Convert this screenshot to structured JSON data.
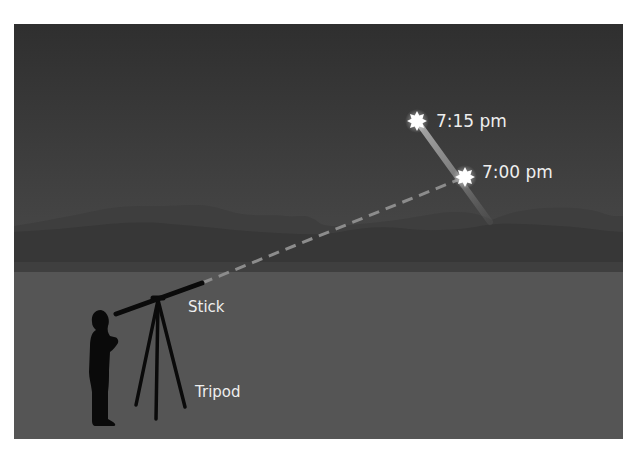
{
  "figure": {
    "colors": {
      "background": "#ffffff",
      "sky_top": "#2f2f2f",
      "sky_bottom": "#4a4a4a",
      "far_mountains": "#3e3e3e",
      "near_mountains": "#363636",
      "ground": "#555555",
      "silhouette": "#0a0a0a",
      "star": "#ffffff",
      "trail": "#9a9a9a",
      "dashed_line": "#8c8c8c",
      "label_text": "#eeeeee"
    }
  },
  "labels": {
    "star_later": "7:15 pm",
    "star_earlier": "7:00 pm",
    "stick": "Stick",
    "tripod": "Tripod"
  }
}
